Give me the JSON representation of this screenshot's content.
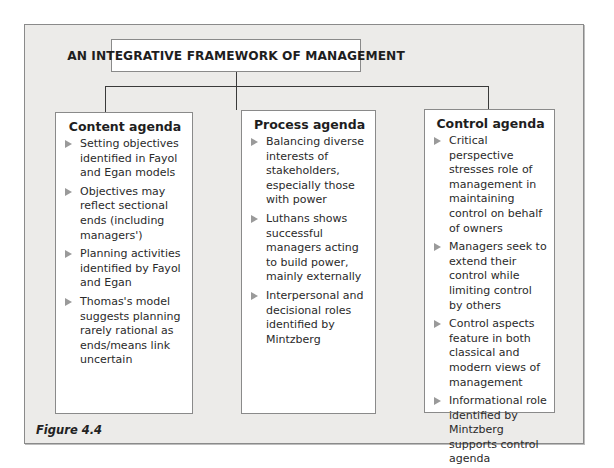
{
  "diagram": {
    "title": "AN INTEGRATIVE FRAMEWORK OF MANAGEMENT",
    "figure_label": "Figure 4.4",
    "agendas": [
      {
        "heading": "Content agenda",
        "items": [
          "Setting objectives identified in Fayol and Egan models",
          "Objectives may reflect sectional ends (including managers')",
          "Planning activities identified by Fayol and Egan",
          "Thomas's model suggests planning rarely rational as ends/means link uncertain"
        ]
      },
      {
        "heading": "Process agenda",
        "items": [
          "Balancing diverse interests of stakeholders, especially those with power",
          "Luthans shows successful managers acting to build power, mainly externally",
          "Interpersonal and decisional roles identified by Mintzberg"
        ]
      },
      {
        "heading": "Control agenda",
        "items": [
          "Critical perspective stresses role of management in maintaining control on behalf of owners",
          "Managers seek to extend their control while limiting control by others",
          "Control aspects feature in both classical and modern views of management",
          "Informational role identified by Mintzberg supports control agenda"
        ]
      }
    ],
    "bullet_icon": "right-triangle-bullet",
    "colors": {
      "frame_bg": "#ecebe9",
      "box_bg": "#ffffff",
      "border": "#8a8a8a",
      "bullet": "#9a9a9a"
    }
  }
}
